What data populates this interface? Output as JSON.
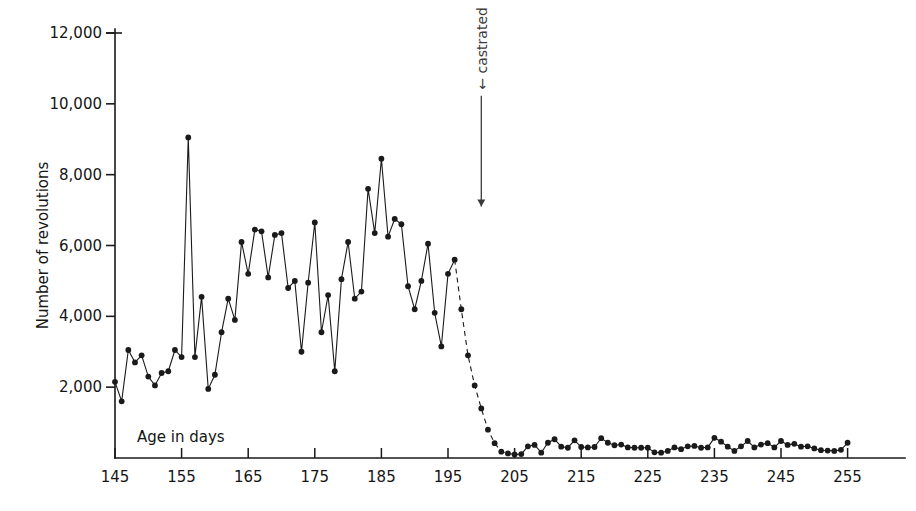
{
  "chart_data": {
    "type": "line",
    "title": "",
    "xlabel": "Age in days",
    "ylabel": "Number of revolutions",
    "xlim": [
      145,
      256
    ],
    "ylim": [
      0,
      12000
    ],
    "grid": false,
    "legend": "none",
    "xticks": [
      145,
      155,
      165,
      175,
      185,
      195,
      205,
      215,
      225,
      235,
      245,
      255
    ],
    "xtick_labels": [
      "145",
      "155",
      "165",
      "175",
      "185",
      "195",
      "205",
      "215",
      "225",
      "235",
      "245",
      "255"
    ],
    "yticks": [
      2000,
      4000,
      6000,
      8000,
      10000,
      12000
    ],
    "ytick_labels": [
      "2,000",
      "4,000",
      "6,000",
      "8,000",
      "10,000",
      "12,000"
    ],
    "marker": "filled-circle",
    "line_color": "#1a1a1a",
    "annotations": [
      {
        "text": "← castrated",
        "orientation": "vertical-down-arrow",
        "x": 200,
        "y_top": 10400,
        "y_arrow_tip": 7100
      }
    ],
    "series": [
      {
        "name": "revolutions-precastration",
        "style": "solid",
        "x": [
          145,
          146,
          147,
          148,
          149,
          150,
          151,
          152,
          153,
          154,
          155,
          156,
          157,
          158,
          159,
          160,
          161,
          162,
          163,
          164,
          165,
          166,
          167,
          168,
          169,
          170,
          171,
          172,
          173,
          174,
          175,
          176,
          177,
          178,
          179,
          180,
          181,
          182,
          183,
          184,
          185,
          186,
          187,
          188,
          189,
          190,
          191,
          192,
          193,
          194,
          195,
          196
        ],
        "y": [
          2150,
          1600,
          3050,
          2700,
          2900,
          2300,
          2050,
          2400,
          2450,
          3050,
          2850,
          9050,
          2850,
          4550,
          1950,
          2350,
          3550,
          4500,
          3900,
          6100,
          5200,
          6450,
          6400,
          5100,
          6300,
          6350,
          4800,
          5000,
          3000,
          4950,
          6650,
          3550,
          4600,
          2450,
          5050,
          6100,
          4500,
          4700,
          7600,
          6350,
          8450,
          6250,
          6750,
          6600,
          4850,
          4200,
          5000,
          6050,
          4100,
          3150,
          5200,
          5600
        ]
      },
      {
        "name": "revolutions-decline-interpolated",
        "style": "dashed",
        "x": [
          196,
          197,
          198,
          199,
          200,
          201,
          202,
          203,
          204
        ],
        "y": [
          5600,
          4200,
          2900,
          2050,
          1400,
          800,
          420,
          180,
          130
        ]
      },
      {
        "name": "revolutions-postcastration",
        "style": "solid",
        "x": [
          204,
          205,
          206,
          207,
          208,
          209,
          210,
          211,
          212,
          213,
          214,
          215,
          216,
          217,
          218,
          219,
          220,
          221,
          222,
          223,
          224,
          225,
          226,
          227,
          228,
          229,
          230,
          231,
          232,
          233,
          234,
          235,
          236,
          237,
          238,
          239,
          240,
          241,
          242,
          243,
          244,
          245,
          246,
          247,
          248,
          249,
          250,
          251,
          252,
          253,
          254,
          255
        ],
        "y": [
          130,
          100,
          110,
          330,
          370,
          150,
          430,
          530,
          320,
          290,
          500,
          310,
          300,
          310,
          560,
          430,
          360,
          380,
          300,
          290,
          290,
          290,
          160,
          150,
          200,
          300,
          250,
          330,
          340,
          290,
          300,
          570,
          460,
          320,
          200,
          330,
          480,
          300,
          380,
          420,
          300,
          480,
          370,
          400,
          320,
          330,
          270,
          220,
          210,
          200,
          230,
          430
        ]
      }
    ]
  },
  "axis": {
    "x_title": "Age in days",
    "y_title": "Number of revolutions"
  }
}
